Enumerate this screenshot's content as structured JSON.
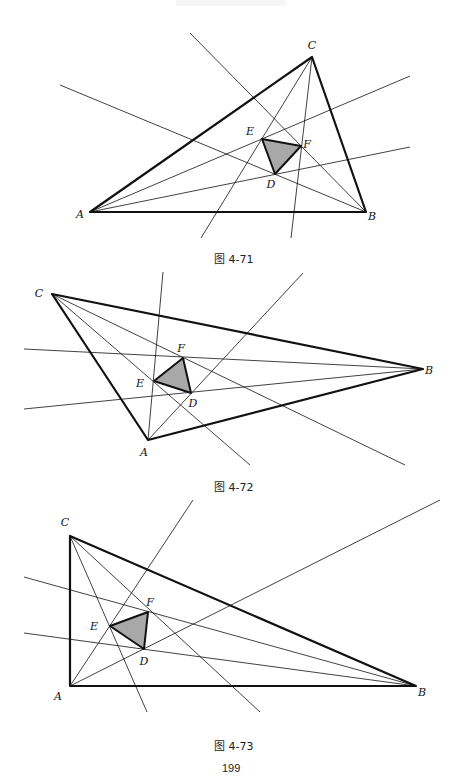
{
  "page": {
    "page_number": "199"
  },
  "figures": [
    {
      "id": "fig-4-71",
      "caption": "图 4-71",
      "caption_pos": [
        214,
        258
      ],
      "vertices": {
        "A": {
          "x": 90,
          "y": 212,
          "label_dx": -10,
          "label_dy": 6
        },
        "B": {
          "x": 366,
          "y": 212,
          "label_dx": 6,
          "label_dy": 8
        },
        "C": {
          "x": 312,
          "y": 57,
          "label_dx": 0,
          "label_dy": -8
        }
      },
      "inner": {
        "E": {
          "x": 262,
          "y": 139,
          "label_dx": -12,
          "label_dy": -4
        },
        "F": {
          "x": 301,
          "y": 146,
          "label_dx": 6,
          "label_dy": 2
        },
        "D": {
          "x": 275,
          "y": 174,
          "label_dx": -4,
          "label_dy": 14
        }
      },
      "lines": [
        [
          [
            60,
            85
          ],
          [
            366,
            212
          ]
        ],
        [
          [
            190,
            33
          ],
          [
            366,
            212
          ]
        ],
        [
          [
            90,
            212
          ],
          [
            410,
            76
          ]
        ],
        [
          [
            90,
            212
          ],
          [
            410,
            147
          ]
        ],
        [
          [
            312,
            57
          ],
          [
            201,
            238
          ]
        ],
        [
          [
            312,
            57
          ],
          [
            291,
            238
          ]
        ]
      ]
    },
    {
      "id": "fig-4-72",
      "caption": "图 4-72",
      "caption_pos": [
        214,
        486
      ],
      "vertices": {
        "A": {
          "x": 148,
          "y": 440,
          "label_dx": -4,
          "label_dy": 16
        },
        "B": {
          "x": 423,
          "y": 369,
          "label_dx": 6,
          "label_dy": 5
        },
        "C": {
          "x": 52,
          "y": 294,
          "label_dx": -13,
          "label_dy": 3
        }
      },
      "inner": {
        "E": {
          "x": 154,
          "y": 381,
          "label_dx": -14,
          "label_dy": 6
        },
        "F": {
          "x": 183,
          "y": 358,
          "label_dx": -2,
          "label_dy": -6
        },
        "D": {
          "x": 191,
          "y": 393,
          "label_dx": 2,
          "label_dy": 14
        }
      },
      "lines": [
        [
          [
            24,
            349
          ],
          [
            423,
            369
          ]
        ],
        [
          [
            24,
            409
          ],
          [
            423,
            369
          ]
        ],
        [
          [
            52,
            294
          ],
          [
            250,
            465
          ]
        ],
        [
          [
            52,
            294
          ],
          [
            405,
            465
          ]
        ],
        [
          [
            148,
            440
          ],
          [
            163,
            272
          ]
        ],
        [
          [
            148,
            440
          ],
          [
            303,
            273
          ]
        ]
      ]
    },
    {
      "id": "fig-4-73",
      "caption": "图 4-73",
      "caption_pos": [
        214,
        745
      ],
      "vertices": {
        "A": {
          "x": 70,
          "y": 686,
          "label_dx": -12,
          "label_dy": 14
        },
        "B": {
          "x": 416,
          "y": 686,
          "label_dx": 6,
          "label_dy": 10
        },
        "C": {
          "x": 70,
          "y": 536,
          "label_dx": -5,
          "label_dy": -10
        }
      },
      "inner": {
        "E": {
          "x": 110,
          "y": 626,
          "label_dx": -16,
          "label_dy": 4
        },
        "F": {
          "x": 148,
          "y": 612,
          "label_dx": 2,
          "label_dy": -6
        },
        "D": {
          "x": 144,
          "y": 649,
          "label_dx": 0,
          "label_dy": 16
        }
      },
      "lines": [
        [
          [
            24,
            577
          ],
          [
            416,
            686
          ]
        ],
        [
          [
            24,
            633
          ],
          [
            416,
            686
          ]
        ],
        [
          [
            70,
            536
          ],
          [
            147,
            712
          ]
        ],
        [
          [
            70,
            536
          ],
          [
            260,
            712
          ]
        ],
        [
          [
            70,
            686
          ],
          [
            193,
            500
          ]
        ],
        [
          [
            70,
            686
          ],
          [
            440,
            500
          ]
        ]
      ]
    }
  ],
  "colors": {
    "stroke": "#111111",
    "fill_inner": "#a8a8a8",
    "background": "#ffffff"
  },
  "header": {
    "faint_text": ""
  }
}
